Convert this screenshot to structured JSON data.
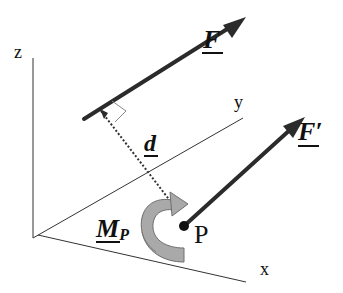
{
  "diagram": {
    "axes": {
      "x_label": "x",
      "y_label": "y",
      "z_label": "z"
    },
    "vectors": {
      "force_label": "F",
      "moved_force_label": "F′",
      "distance_label": "d",
      "moment_label": "M",
      "moment_subscript": "P"
    },
    "point": {
      "label": "P"
    },
    "colors": {
      "vector": "#2b2b2b",
      "axis": "#333333",
      "moment_fill": "#a9a9a9",
      "moment_stroke": "#6e6e6e",
      "perpendicular_marker": "#888888"
    }
  }
}
